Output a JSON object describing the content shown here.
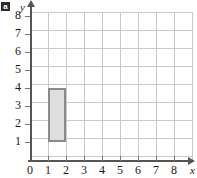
{
  "figure": {
    "part_label": "a"
  },
  "chart_data": {
    "type": "scatter",
    "title": "",
    "xlabel": "x",
    "ylabel": "y",
    "xlim": [
      0,
      9
    ],
    "ylim": [
      0,
      9
    ],
    "grid": true,
    "legend": "none",
    "x_ticks": [
      "0",
      "1",
      "2",
      "3",
      "4",
      "5",
      "6",
      "7",
      "8"
    ],
    "y_ticks": [
      "1",
      "2",
      "3",
      "4",
      "5",
      "6",
      "7",
      "8"
    ],
    "x_tick_values": [
      0,
      1,
      2,
      3,
      4,
      5,
      6,
      7,
      8
    ],
    "y_tick_values": [
      1,
      2,
      3,
      4,
      5,
      6,
      7,
      8
    ],
    "shapes": [
      {
        "name": "rectangle",
        "x_min": 1,
        "x_max": 2,
        "y_min": 1,
        "y_max": 4,
        "width": 1,
        "height": 3,
        "fill": "#dedede",
        "stroke": "#8a8a8a",
        "vertices": [
          [
            1,
            1
          ],
          [
            2,
            1
          ],
          [
            2,
            4
          ],
          [
            1,
            4
          ]
        ]
      }
    ],
    "colors": {
      "grid": "#c9c9c9",
      "axis": "#555555",
      "shape_fill": "#dedede",
      "shape_stroke": "#8a8a8a",
      "text": "#1a1a1a"
    }
  }
}
